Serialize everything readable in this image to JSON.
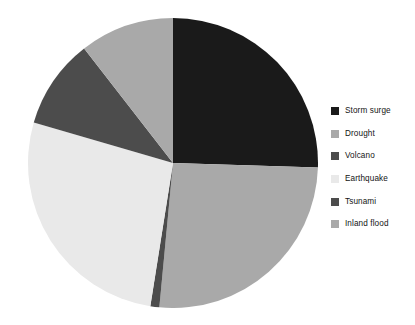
{
  "figure": {
    "background_color": "#ffffff",
    "width": 415,
    "height": 325
  },
  "legend": {
    "position": "right",
    "items": [
      {
        "label": "Storm surge",
        "color": "#1a1a1a",
        "swatch_name": "legend-swatch-storm-surge"
      },
      {
        "label": "Drought",
        "color": "#a9a9a9",
        "swatch_name": "legend-swatch-drought"
      },
      {
        "label": "Volcano",
        "color": "#4c4c4c",
        "swatch_name": "legend-swatch-volcano"
      },
      {
        "label": "Earthquake",
        "color": "#e9e9e9",
        "swatch_name": "legend-swatch-earthquake"
      },
      {
        "label": "Tsunami",
        "color": "#4c4c4c",
        "swatch_name": "legend-swatch-tsunami"
      },
      {
        "label": "Inland flood",
        "color": "#a9a9a9",
        "swatch_name": "legend-swatch-inland-flood"
      }
    ]
  },
  "chart_data": {
    "type": "pie",
    "title": "",
    "xlabel": "",
    "ylabel": "",
    "start_angle_deg": 90,
    "direction": "clockwise",
    "grid": false,
    "legend_position": "right",
    "categories": [
      "Storm surge",
      "Drought",
      "Volcano",
      "Earthquake",
      "Tsunami",
      "Inland flood"
    ],
    "values": [
      25.5,
      26.0,
      1.0,
      27.0,
      10.0,
      10.5
    ],
    "colors": [
      "#1a1a1a",
      "#a9a9a9",
      "#4c4c4c",
      "#e9e9e9",
      "#4c4c4c",
      "#a9a9a9"
    ],
    "slice_angles_deg": [
      91.8,
      93.6,
      3.6,
      97.2,
      36.0,
      37.8
    ],
    "geometry": {
      "center_x": 145,
      "center_y": 145,
      "radius": 145
    }
  }
}
